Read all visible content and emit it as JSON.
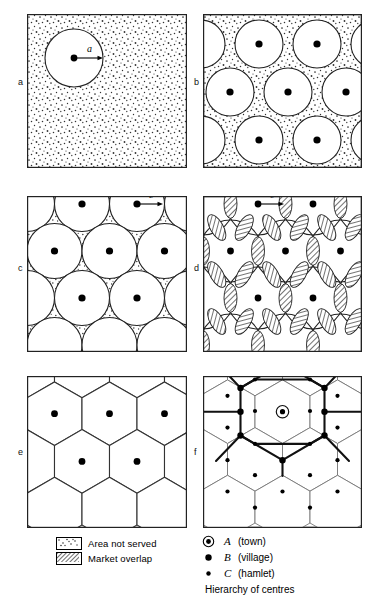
{
  "figure": {
    "title": "Hierarchy of centres",
    "panels": [
      {
        "id": "a",
        "label": "a",
        "annotation": "a",
        "caption": "dispersed population with one circular market area of radius a"
      },
      {
        "id": "b",
        "label": "b",
        "annotation": "",
        "caption": "separate circular market areas leaving area not served"
      },
      {
        "id": "c",
        "label": "c",
        "annotation": "b",
        "caption": "tangent circular market areas of radius b with interstitial area not served"
      },
      {
        "id": "d",
        "label": "d",
        "annotation": "c",
        "caption": "overlapping circular market areas of radius c producing market overlap"
      },
      {
        "id": "e",
        "label": "e",
        "annotation": "",
        "caption": "hexagonal market areas"
      },
      {
        "id": "f",
        "label": "f",
        "annotation": "",
        "caption": "hierarchy of centres with transport network"
      }
    ]
  },
  "legend": {
    "items": [
      {
        "pattern": "dotted",
        "label": "Area not served"
      },
      {
        "pattern": "hatched",
        "label": "Market overlap"
      }
    ]
  },
  "key": {
    "caption": "Hierarchy of centres",
    "items": [
      {
        "symbol": "circled-dot",
        "letter": "A",
        "name": "(town)"
      },
      {
        "symbol": "large-dot",
        "letter": "B",
        "name": "(village)"
      },
      {
        "symbol": "small-dot",
        "letter": "C",
        "name": "(hamlet)"
      }
    ]
  },
  "colors": {
    "ink": "#1a1a1a",
    "line": "#222222",
    "fill": "#ffffff",
    "hatch": "#555555",
    "stipple": "#333333"
  }
}
